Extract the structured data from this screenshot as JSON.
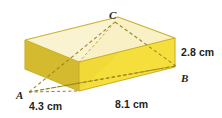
{
  "figure": {
    "kind": "rectangular-prism-diagram",
    "vertices": [
      {
        "id": "C",
        "label": "C",
        "position": "top"
      },
      {
        "id": "A",
        "label": "A",
        "position": "bottom-left-front"
      },
      {
        "id": "B",
        "label": "B",
        "position": "bottom-right-front"
      }
    ],
    "dimensions": [
      {
        "id": "width",
        "label": "4.3 cm",
        "value": 4.3,
        "unit": "cm",
        "edge": "front-bottom-left"
      },
      {
        "id": "length",
        "label": "8.1 cm",
        "value": 8.1,
        "unit": "cm",
        "edge": "front-bottom"
      },
      {
        "id": "height",
        "label": "2.8 cm",
        "value": 2.8,
        "unit": "cm",
        "edge": "right-vertical"
      }
    ],
    "colors": {
      "top_face": "#faf3d2",
      "top_face_shade": "#f6ecb4",
      "left_face": "#d3ba2e",
      "front_face": "#f4df3c",
      "front_face_shade": "#ecd233",
      "right_face": "#e9cf33",
      "edge_line": "#c9ae28",
      "dashed_line": "#9a8420",
      "background": "#ffffff",
      "text": "#231f20"
    }
  }
}
